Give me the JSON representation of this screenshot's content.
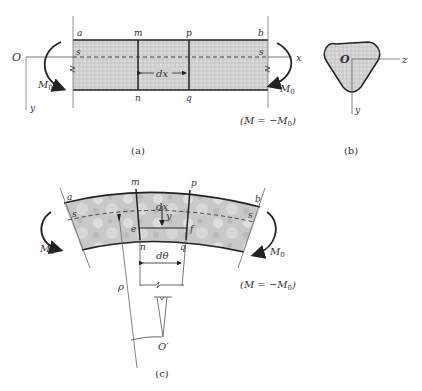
{
  "figure_a": {
    "caption": "(a)",
    "origin": "O",
    "x_axis": "x",
    "y_axis": "y",
    "corner_top_left": "a",
    "corner_top_right": "b",
    "section_top_1": "m",
    "section_top_2": "p",
    "section_bottom_1": "n",
    "section_bottom_2": "q",
    "neutral_left": "s",
    "neutral_right": "s",
    "element_length": "dx",
    "moment_left": "M",
    "moment_left_sub": "0",
    "moment_right": "M",
    "moment_right_sub": "0",
    "equation": "(M = −M",
    "equation_sub": "0",
    "equation_close": ")"
  },
  "figure_b": {
    "caption": "(b)",
    "origin": "O",
    "z_axis": "z",
    "y_axis": "y"
  },
  "figure_c": {
    "caption": "(c)",
    "corner_top_left": "a",
    "corner_top_right": "b",
    "section_top_1": "m",
    "section_top_2": "p",
    "section_bottom_1": "n",
    "section_bottom_2": "q",
    "fiber_left": "e",
    "fiber_right": "f",
    "neutral_left": "s",
    "neutral_right": "s",
    "element_length": "dx",
    "fiber_distance": "y",
    "angle": "dθ",
    "radius": "ρ",
    "center": "O′",
    "moment_left": "M",
    "moment_left_sub": "0",
    "moment_right": "M",
    "moment_right_sub": "0",
    "equation": "(M = −M",
    "equation_sub": "0",
    "equation_close": ")"
  },
  "colors": {
    "fill": "#d4d4d4",
    "stroke": "#222222",
    "thin": "#777777"
  }
}
